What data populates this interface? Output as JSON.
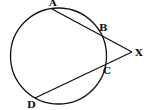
{
  "diagram": {
    "type": "geometry",
    "circle": {
      "cx": 58.5,
      "cy": 56,
      "r": 48
    },
    "points": {
      "A": {
        "label": "A",
        "x": 52,
        "y": 9,
        "label_x": 49,
        "label_y": 6
      },
      "B": {
        "label": "B",
        "x": 98,
        "y": 33,
        "label_x": 99,
        "label_y": 31
      },
      "X": {
        "label": "X",
        "x": 132,
        "y": 52,
        "label_x": 135,
        "label_y": 56
      },
      "C": {
        "label": "C",
        "x": 104,
        "y": 64,
        "label_x": 103,
        "label_y": 74
      },
      "D": {
        "label": "D",
        "x": 35,
        "y": 98,
        "label_x": 27,
        "label_y": 108
      }
    },
    "segments": [
      {
        "from": "A",
        "to": "X"
      },
      {
        "from": "D",
        "to": "X"
      }
    ],
    "stroke_color": "#111111"
  }
}
